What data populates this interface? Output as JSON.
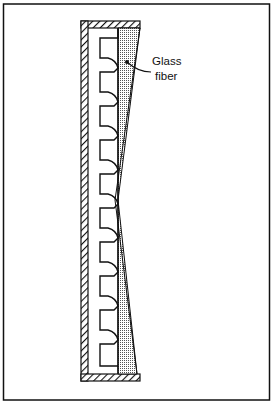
{
  "figure": {
    "label_line1": "Glass",
    "label_line2": "fiber",
    "colors": {
      "stroke": "#111111",
      "background": "#ffffff",
      "stipple": "#555555"
    }
  }
}
